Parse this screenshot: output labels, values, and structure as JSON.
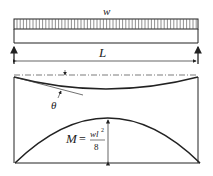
{
  "diagram": {
    "type": "simply-supported beam with uniform load",
    "load": {
      "label": "w",
      "kind": "uniformly distributed"
    },
    "span": {
      "label": "L"
    },
    "deflection": {
      "angle_label": "θ"
    },
    "moment": {
      "lhs": "M",
      "eq": "=",
      "numerator": "wl",
      "exponent": "2",
      "denominator": "8"
    },
    "colors": {
      "line": "#222222",
      "background": "#ffffff"
    }
  }
}
